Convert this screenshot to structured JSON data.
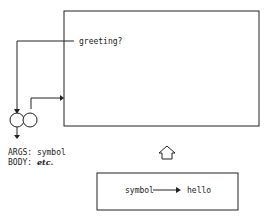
{
  "global_env": {
    "binding_label": "greeting?"
  },
  "procedure": {
    "args_label": "ARGS:",
    "args_value": "symbol",
    "body_label": "BODY:",
    "body_value": "etc."
  },
  "frame": {
    "from": "symbol",
    "to": "hello"
  }
}
